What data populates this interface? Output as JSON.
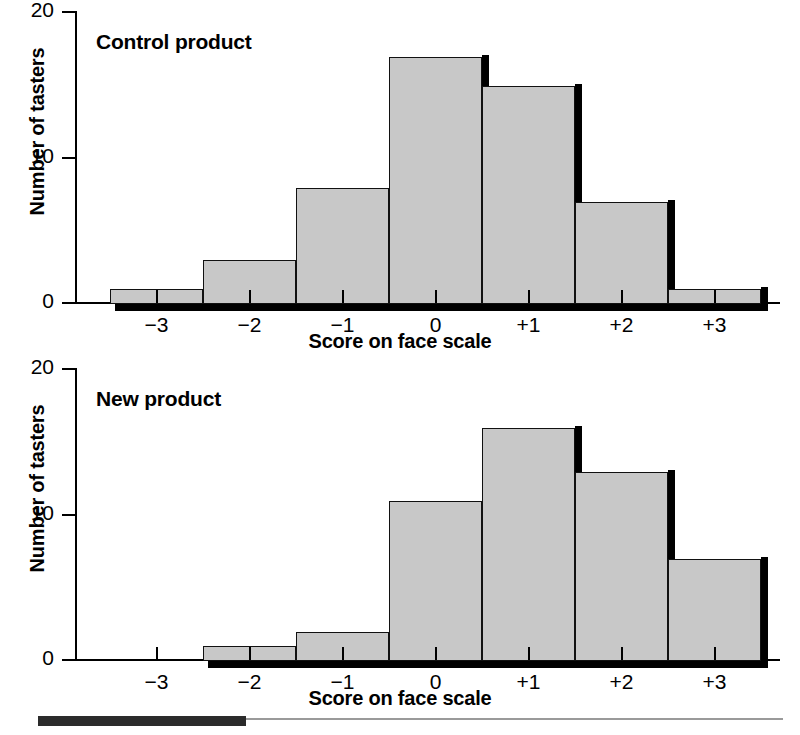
{
  "figure": {
    "width": 800,
    "height": 735,
    "bar_fill_color": "#c8c8c8",
    "bar_edge_color": "#111111",
    "shadow_color": "#000000",
    "footer_rule_color": "#9a9a9a",
    "footer_block_color": "#2b2b2b"
  },
  "chart_data": [
    {
      "type": "bar",
      "title": "Control product",
      "xlabel": "Score on face scale",
      "ylabel": "Number of tasters",
      "categories": [
        "−3",
        "−2",
        "−1",
        "0",
        "+1",
        "+2",
        "+3"
      ],
      "values": [
        1,
        3,
        8,
        17,
        15,
        7,
        1
      ],
      "ylim": [
        0,
        20
      ],
      "yticks": [
        0,
        10,
        20
      ],
      "ytick_labels": [
        "0",
        "10",
        "20"
      ],
      "grid": false,
      "legend": "none"
    },
    {
      "type": "bar",
      "title": "New product",
      "xlabel": "Score on face scale",
      "ylabel": "Number of tasters",
      "categories": [
        "−3",
        "−2",
        "−1",
        "0",
        "+1",
        "+2",
        "+3"
      ],
      "values": [
        0,
        1,
        2,
        11,
        16,
        13,
        7
      ],
      "ylim": [
        0,
        20
      ],
      "yticks": [
        0,
        10,
        20
      ],
      "ytick_labels": [
        "0",
        "10",
        "20"
      ],
      "grid": false,
      "legend": "none"
    }
  ]
}
